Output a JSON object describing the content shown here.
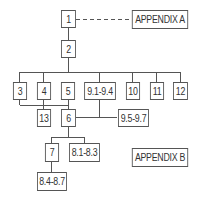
{
  "diagram": {
    "type": "hierarchy",
    "line_color": "#555555",
    "nodes": {
      "n1": "1",
      "n2": "2",
      "n3": "3",
      "n4": "4",
      "n5": "5",
      "n9_1": "9.1-9.4",
      "n10": "10",
      "n11": "11",
      "n12": "12",
      "n13": "13",
      "n6": "6",
      "n9_5": "9.5-9.7",
      "n7": "7",
      "n8_1": "8.1-8.3",
      "n8_4": "8.4-8.7",
      "appA": "APPENDIX A",
      "appB": "APPENDIX B"
    },
    "edges": [
      {
        "from": "1",
        "to": "APPENDIX A",
        "style": "dashed"
      },
      {
        "from": "1",
        "to": "2",
        "style": "solid"
      },
      {
        "from": "2",
        "to": [
          "3",
          "4",
          "5",
          "9.1-9.4",
          "10",
          "11",
          "12"
        ],
        "style": "solid"
      },
      {
        "from": [
          "3",
          "4",
          "5"
        ],
        "to": [
          "13",
          "6"
        ],
        "style": "solid"
      },
      {
        "from": "9.1-9.4",
        "to": [
          "6",
          "9.5-9.7"
        ],
        "style": "solid"
      },
      {
        "from": "6",
        "to": [
          "7",
          "8.1-8.3"
        ],
        "style": "solid"
      },
      {
        "from": "7",
        "to": "8.4-8.7",
        "style": "solid"
      }
    ]
  }
}
